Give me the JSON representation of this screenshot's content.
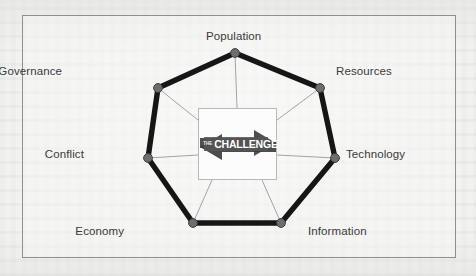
{
  "figure": {
    "center": {
      "banner_label": "CHALLENGE",
      "banner_prefix": "THE",
      "banner_shape": "double-headed-arrow"
    },
    "colors": {
      "background": "#f2f2f0",
      "frame_border": "#8f8f8f",
      "polygon_edge": "#161616",
      "node_fill": "#6e6e6e",
      "node_stroke": "#3d3d3d",
      "spoke": "#9a9a9a",
      "banner_fill": "#4a4a4a",
      "banner_dark": "#3a3a3a",
      "label_text": "#3a3a3a",
      "card_fill": "#fcfcfc"
    },
    "nodes": [
      {
        "id": "population",
        "label": "Population",
        "x": 235,
        "y": 53,
        "label_x": 206,
        "label_y": 30,
        "label_align": "center"
      },
      {
        "id": "resources",
        "label": "Resources",
        "x": 320,
        "y": 88,
        "label_x": 336,
        "label_y": 65,
        "label_align": "left"
      },
      {
        "id": "technology",
        "label": "Technology",
        "x": 335,
        "y": 158,
        "label_x": 346,
        "label_y": 148,
        "label_align": "left"
      },
      {
        "id": "information",
        "label": "Information",
        "x": 281,
        "y": 223,
        "label_x": 308,
        "label_y": 225,
        "label_align": "left"
      },
      {
        "id": "economy",
        "label": "Economy",
        "x": 193,
        "y": 223,
        "label_x": 124,
        "label_y": 225,
        "label_align": "right"
      },
      {
        "id": "conflict",
        "label": "Conflict",
        "x": 148,
        "y": 158,
        "label_x": 84,
        "label_y": 148,
        "label_align": "right"
      },
      {
        "id": "governance",
        "label": "Governance",
        "x": 158,
        "y": 88,
        "label_x": 62,
        "label_y": 65,
        "label_align": "right"
      }
    ],
    "edges": [
      {
        "from": "population",
        "to": "resources"
      },
      {
        "from": "resources",
        "to": "technology"
      },
      {
        "from": "technology",
        "to": "information"
      },
      {
        "from": "information",
        "to": "economy"
      },
      {
        "from": "economy",
        "to": "conflict"
      },
      {
        "from": "conflict",
        "to": "governance"
      },
      {
        "from": "governance",
        "to": "population"
      }
    ],
    "spokes": [
      {
        "node": "population",
        "cx": 237,
        "cy": 108
      },
      {
        "node": "resources",
        "cx": 277,
        "cy": 120
      },
      {
        "node": "technology",
        "cx": 277,
        "cy": 155
      },
      {
        "node": "information",
        "cx": 262,
        "cy": 180
      },
      {
        "node": "economy",
        "cx": 212,
        "cy": 180
      },
      {
        "node": "conflict",
        "cx": 198,
        "cy": 155
      },
      {
        "node": "governance",
        "cx": 198,
        "cy": 120
      }
    ]
  }
}
